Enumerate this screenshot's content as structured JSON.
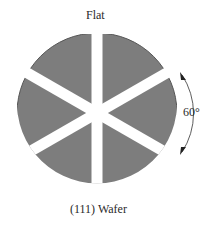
{
  "diagram": {
    "title": "(111) Wafer",
    "flat_label": "Flat",
    "angle_label": "60°",
    "wafer_color": "#7d7d7d",
    "gap_color": "#ffffff",
    "segments": 6,
    "segment_angle_deg": 60
  }
}
